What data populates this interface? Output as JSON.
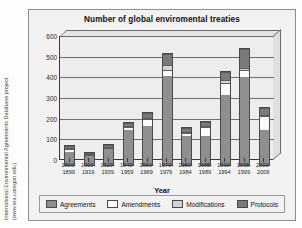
{
  "credit": {
    "line1": "International Environmental Agreements Database project",
    "line2": "(www.iea.uoregon.edu)"
  },
  "chart_data": {
    "type": "bar",
    "stacked": true,
    "title": "Number of global enviromental treaties",
    "xlabel": "Year",
    "ylabel": "",
    "ylim": [
      0,
      600
    ],
    "yticks": [
      0,
      100,
      200,
      300,
      400,
      500,
      600
    ],
    "grid": true,
    "legend_position": "bottom",
    "categories": [
      "1800-1899",
      "1900-1919",
      "1920-1939",
      "1940-1959",
      "1960-1969",
      "1970-1979",
      "1980-1984",
      "1985-1989",
      "1990-1994",
      "1995-1999",
      "2000-2009"
    ],
    "series": [
      {
        "name": "Agreements",
        "color": "#8f8f8f",
        "values": [
          62,
          42,
          78,
          168,
          190,
          430,
          142,
          140,
          338,
          428,
          168
        ]
      },
      {
        "name": "Amendments",
        "color": "#fbfbfb",
        "values": [
          14,
          6,
          6,
          16,
          32,
          32,
          14,
          44,
          58,
          30,
          68
        ]
      },
      {
        "name": "Modifications",
        "color": "#d2d2d2",
        "values": [
          4,
          2,
          2,
          4,
          6,
          22,
          4,
          6,
          16,
          10,
          8
        ]
      },
      {
        "name": "Protocols",
        "color": "#7a7a7a",
        "values": [
          12,
          4,
          6,
          14,
          22,
          54,
          18,
          20,
          36,
          94,
          34
        ]
      }
    ],
    "totals": [
      92,
      54,
      92,
      202,
      250,
      538,
      178,
      210,
      448,
      562,
      278
    ]
  },
  "legend": {
    "items": [
      {
        "label": "Agreements",
        "key": "agreements"
      },
      {
        "label": "Amendments",
        "key": "amendments"
      },
      {
        "label": "Modifications",
        "key": "modifications"
      },
      {
        "label": "Protocols",
        "key": "protocols"
      }
    ]
  }
}
